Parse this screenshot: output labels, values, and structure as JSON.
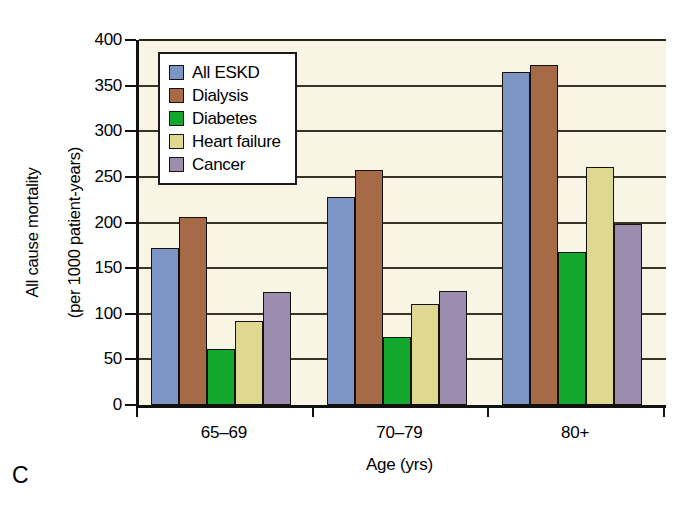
{
  "panel_label": "C",
  "chart_data": {
    "type": "bar",
    "title": "",
    "subtitle": "",
    "xlabel": "Age (yrs)",
    "ylabel": "All cause mortality (per 1000 patient-years)",
    "ylabel_lines": [
      "All cause mortality",
      "(per 1000 patient-years)"
    ],
    "categories": [
      "65–69",
      "70–79",
      "80+"
    ],
    "ylim": [
      0,
      400
    ],
    "ytick_values": [
      0,
      50,
      100,
      150,
      200,
      250,
      300,
      350,
      400
    ],
    "ytick_labels": [
      "0",
      "50",
      "100",
      "150",
      "200",
      "250",
      "300",
      "350",
      "400"
    ],
    "grid": true,
    "grid_axis": "y",
    "legend_position": "top-left-inside",
    "plot_background": "#f8f5e4",
    "series": [
      {
        "name": "All ESKD",
        "color": "#7d95c4",
        "values": [
          172,
          228,
          365
        ]
      },
      {
        "name": "Dialysis",
        "color": "#a76a46",
        "values": [
          206,
          258,
          373
        ]
      },
      {
        "name": "Diabetes",
        "color": "#12a82e",
        "values": [
          61,
          74,
          168
        ]
      },
      {
        "name": "Heart failure",
        "color": "#ded890",
        "values": [
          92,
          111,
          261
        ]
      },
      {
        "name": "Cancer",
        "color": "#9c8cad",
        "values": [
          124,
          125,
          198
        ]
      }
    ]
  }
}
